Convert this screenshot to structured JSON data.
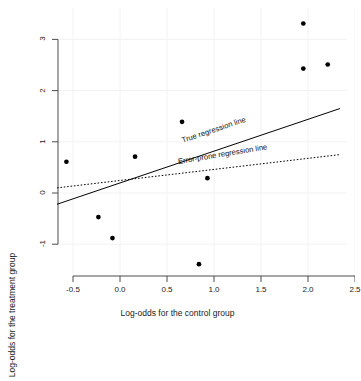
{
  "chart_data": {
    "type": "scatter",
    "title": "",
    "xlabel": "Log-odds for the control group",
    "ylabel": "Log-odds for the treatment group",
    "xlim": [
      -0.75,
      2.65
    ],
    "ylim": [
      -1.55,
      3.45
    ],
    "grid": true,
    "xticks": [
      -0.5,
      0.0,
      0.5,
      1.0,
      1.5,
      2.0,
      2.5
    ],
    "xtick_labels": [
      "-0.5",
      "0.0",
      "0.5",
      "1.0",
      "1.5",
      "2.0",
      "2.5"
    ],
    "yticks": [
      -1,
      0,
      1,
      2,
      3
    ],
    "ytick_labels": [
      "-1",
      "0",
      "1",
      "2",
      "3"
    ],
    "points": [
      {
        "x": -0.57,
        "y": 0.61
      },
      {
        "x": -0.23,
        "y": -0.47
      },
      {
        "x": -0.08,
        "y": -0.88
      },
      {
        "x": 0.16,
        "y": 0.71
      },
      {
        "x": 0.66,
        "y": 1.39
      },
      {
        "x": 0.84,
        "y": -1.39
      },
      {
        "x": 0.93,
        "y": 0.29
      },
      {
        "x": 1.95,
        "y": 3.31
      },
      {
        "x": 1.95,
        "y": 2.43
      },
      {
        "x": 2.21,
        "y": 2.51
      }
    ],
    "marker": {
      "shape": "filled-circle",
      "color": "#000000",
      "size": 3.4
    },
    "series": [
      {
        "name": "True regression line",
        "type": "line",
        "style": "solid",
        "color": "#000000",
        "annotation": "True regression line",
        "x_endpoints": [
          -0.67,
          2.34
        ],
        "y_endpoints": [
          -0.22,
          1.65
        ]
      },
      {
        "name": "Error-prone regression line",
        "type": "line",
        "style": "dotted",
        "color": "#000000",
        "annotation": "Error-prone regression line",
        "x_endpoints": [
          -0.67,
          2.34
        ],
        "y_endpoints": [
          0.1,
          0.75
        ]
      }
    ],
    "annotations": [
      {
        "text": "True regression line",
        "x": 0.66,
        "y": 1.02,
        "rotation": -18.6
      },
      {
        "text": "Error-prone regression line",
        "x": 0.62,
        "y": 0.6,
        "rotation": -9.4
      }
    ],
    "legend_position": "none"
  },
  "axes": {
    "x_title": "Log-odds for the control group",
    "y_title": "Log-odds for the treatment group"
  }
}
